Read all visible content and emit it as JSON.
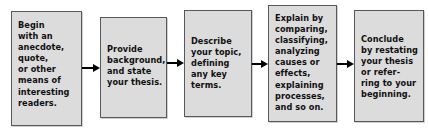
{
  "diagram": {
    "type": "flowchart",
    "orientation": "left-to-right",
    "title": "",
    "box_fill_color": "#dcdcdc",
    "box_border_color": "#58585a",
    "arrow_color": "#000000",
    "background_color": "#ffffff",
    "boxes": [
      {
        "id": "box-1",
        "step": 1,
        "text": "Begin\nwith an\nanecdote,\nquote,\nor other\nmeans of\ninteresting\nreaders.",
        "lines": [
          "Begin",
          "with an",
          "anecdote,",
          "quote,",
          "or other",
          "means of",
          "interesting",
          "readers."
        ]
      },
      {
        "id": "box-2",
        "step": 2,
        "text": "Provide\nbackground,\nand state\nyour thesis.",
        "lines": [
          "Provide",
          "background,",
          "and state",
          "your thesis."
        ]
      },
      {
        "id": "box-3",
        "step": 3,
        "text": "Describe\nyour topic,\ndefining\nany key\nterms.",
        "lines": [
          "Describe",
          "your topic,",
          "defining",
          "any key",
          "terms."
        ]
      },
      {
        "id": "box-4",
        "step": 4,
        "text": "Explain by\ncomparing,\nclassifying,\nanalyzing\ncauses or\neffects,\nexplaining\nprocesses,\nand so on.",
        "lines": [
          "Explain by",
          "comparing,",
          "classifying,",
          "analyzing",
          "causes or",
          "effects,",
          "explaining",
          "processes,",
          "and so on."
        ]
      },
      {
        "id": "box-5",
        "step": 5,
        "text": "Conclude\nby restating\nyour thesis\nor refer-\nring to your\nbeginning.",
        "lines": [
          "Conclude",
          "by restating",
          "your thesis",
          "or refer-",
          "ring to your",
          "beginning."
        ]
      }
    ],
    "connectors": [
      {
        "id": "arrow-1",
        "from": "box-1",
        "to": "box-2",
        "glyph": "arrow-right-icon"
      },
      {
        "id": "arrow-2",
        "from": "box-2",
        "to": "box-3",
        "glyph": "arrow-right-icon"
      },
      {
        "id": "arrow-3",
        "from": "box-3",
        "to": "box-4",
        "glyph": "arrow-right-icon"
      },
      {
        "id": "arrow-4",
        "from": "box-4",
        "to": "box-5",
        "glyph": "arrow-right-icon"
      }
    ]
  }
}
